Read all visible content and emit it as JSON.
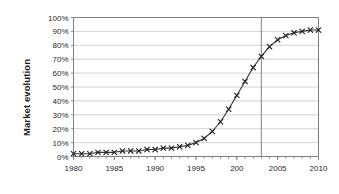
{
  "chart_data": {
    "type": "line",
    "title": "",
    "subtitle": "",
    "xlabel": "",
    "ylabel": "Market evolution",
    "xlim": [
      1980,
      2010
    ],
    "ylim": [
      0,
      100
    ],
    "grid": "horizontal",
    "legend": "none",
    "marker": "x",
    "line_color": "#333333",
    "marker_color": "#222222",
    "grid_color": "#c8c8c8",
    "axis_color": "#808080",
    "y_tick_labels": [
      "0%",
      "10%",
      "20%",
      "30%",
      "40%",
      "50%",
      "60%",
      "70%",
      "80%",
      "90%",
      "100%"
    ],
    "y_ticks": [
      0,
      10,
      20,
      30,
      40,
      50,
      60,
      70,
      80,
      90,
      100
    ],
    "x_tick_labels": [
      "1980",
      "1985",
      "1990",
      "1995",
      "200",
      "2005",
      "2010"
    ],
    "x_ticks": [
      1980,
      1985,
      1990,
      1995,
      2000,
      2005,
      2010
    ],
    "x_minor_step": 1,
    "annotations": [
      {
        "name": "vertical-reference-line",
        "type": "vline",
        "x": 2003,
        "color": "#808080",
        "label": ""
      }
    ],
    "series": [
      {
        "name": "Market evolution",
        "x": [
          1980,
          1981,
          1982,
          1983,
          1984,
          1985,
          1986,
          1987,
          1988,
          1989,
          1990,
          1991,
          1992,
          1993,
          1994,
          1995,
          1996,
          1997,
          1998,
          1999,
          2000,
          2001,
          2002,
          2003,
          2004,
          2005,
          2006,
          2007,
          2008,
          2009,
          2010
        ],
        "values": [
          2,
          2,
          2,
          3,
          3,
          3,
          4,
          4,
          4,
          5,
          5,
          6,
          6,
          7,
          8,
          10,
          13,
          18,
          25,
          34,
          44,
          54,
          64,
          72,
          79,
          84,
          87,
          89,
          90,
          91,
          91
        ]
      }
    ]
  }
}
